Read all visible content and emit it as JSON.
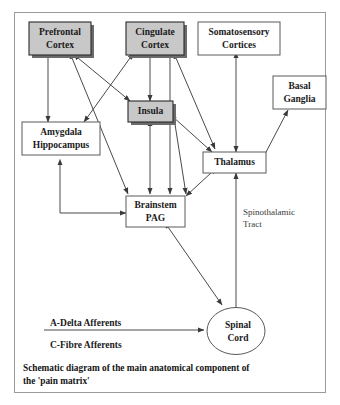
{
  "figure": {
    "outer_border_color": "#9a9a9a",
    "background_color": "#ffffff",
    "line_color": "#4a4a4a",
    "shaded_fill": "#c8c8c8",
    "plain_fill": "#ffffff",
    "shadow_color": "#6b6b6b"
  },
  "nodes": {
    "prefrontal_cortex": {
      "line1": "Prefrontal",
      "line2": "Cortex",
      "shaded": true
    },
    "cingulate_cortex": {
      "line1": "Cingulate",
      "line2": "Cortex",
      "shaded": true
    },
    "somatosensory_cortices": {
      "line1": "Somatosensory",
      "line2": "Cortices",
      "shaded": false
    },
    "basal_ganglia": {
      "line1": "Basal",
      "line2": "Ganglia",
      "shaded": false
    },
    "insula": {
      "line1": "Insula",
      "line2": "",
      "shaded": true
    },
    "amygdala_hippocampus": {
      "line1": "Amygdala",
      "line2": "Hippocampus",
      "shaded": false
    },
    "thalamus": {
      "line1": "Thalamus",
      "line2": "",
      "shaded": false
    },
    "brainstem_pag": {
      "line1": "Brainstem",
      "line2": "PAG",
      "shaded": false
    },
    "spinal_cord": {
      "line1": "Spinal",
      "line2": "Cord",
      "shaded": false
    }
  },
  "annotations": {
    "spinothalamic_tract_line1": "Spinothalamic",
    "spinothalamic_tract_line2": "Tract",
    "a_delta_afferents": "A-Delta Afferents",
    "c_fibre_afferents": "C-Fibre Afferents"
  },
  "caption": {
    "line1": "Schematic diagram of the main anatomical component of",
    "line2": "the 'pain matrix'"
  }
}
